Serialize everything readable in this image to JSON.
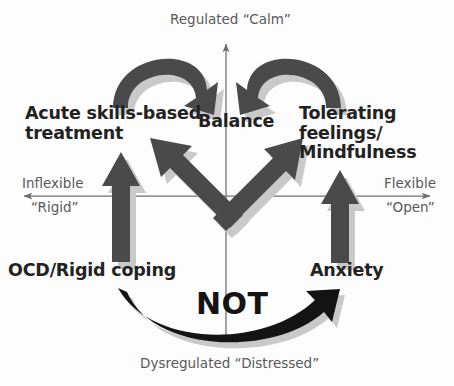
{
  "diagram": {
    "title_axes": {
      "vertical_top": "Regulated “Calm”",
      "vertical_bottom": "Dysregulated “Distressed”",
      "horizontal_left_primary": "Inflexible",
      "horizontal_left_secondary": "“Rigid”",
      "horizontal_right_primary": "Flexible",
      "horizontal_right_secondary": "“Open”"
    },
    "quadrant_labels": {
      "top_left": "Acute skills-based\ntreatment",
      "top_center": "Balance",
      "top_right": "Tolerating\nfeelings/\nMindfulness",
      "bottom_left": "OCD/Rigid coping",
      "bottom_right": "Anxiety"
    },
    "annotation": {
      "not_label": "NOT"
    },
    "colors": {
      "arrow_fill": "#4a4a4a",
      "arrow_shadow": "#c9c9c9",
      "not_arrow": "#141414",
      "axis_line": "#6d6e71",
      "label_text": "#222222",
      "axis_text": "#58595b",
      "background": "#fdfdfd"
    },
    "arrows": {
      "left_vertical": "OCD/Rigid coping rises to Acute skills-based treatment",
      "right_vertical": "Anxiety rises to Tolerating feelings/Mindfulness",
      "diagonal_up_left": "Anxiety to Acute skills-based treatment",
      "diagonal_up_right": "OCD/Rigid coping to Tolerating feelings/Mindfulness",
      "curve_left_to_balance": "Acute skills-based treatment curves to Balance",
      "curve_right_to_balance": "Tolerating feelings/Mindfulness curves to Balance",
      "bottom_not_curve": "OCD/Rigid coping does NOT go to Anxiety"
    }
  }
}
